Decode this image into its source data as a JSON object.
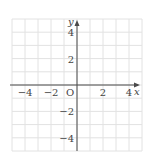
{
  "chart_data": {
    "type": "scatter",
    "title": "",
    "xlabel": "x",
    "ylabel": "y",
    "origin_label": "O",
    "xlim": [
      -5,
      5
    ],
    "ylim": [
      -5,
      5
    ],
    "grid": true,
    "grid_step": 1,
    "x_ticks": [
      {
        "value": -4,
        "label": "−4"
      },
      {
        "value": -2,
        "label": "−2"
      },
      {
        "value": 2,
        "label": "2"
      },
      {
        "value": 4,
        "label": "4"
      }
    ],
    "y_ticks": [
      {
        "value": 4,
        "label": "4"
      },
      {
        "value": 2,
        "label": "2"
      },
      {
        "value": -2,
        "label": "−2"
      },
      {
        "value": -4,
        "label": "−4"
      }
    ],
    "series": []
  },
  "colors": {
    "grid": "#e2e2e2",
    "axis": "#4a4a4a",
    "text": "#444444"
  }
}
